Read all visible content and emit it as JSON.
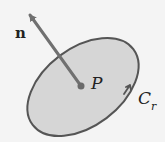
{
  "diagram": {
    "labels": {
      "normal": "n",
      "point": "P",
      "curve": "C",
      "curve_subscript": "r"
    },
    "colors": {
      "background": "#f4f4f4",
      "disk_fill": "#d6d6d6",
      "outline": "#555555",
      "arrow": "#707070",
      "point": "#6a6a6a",
      "text": "#222222"
    }
  }
}
